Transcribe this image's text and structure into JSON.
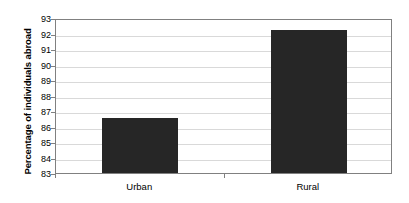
{
  "chart_data": {
    "type": "bar",
    "title": "",
    "xlabel": "",
    "ylabel": "Percentage of individuals abroad",
    "categories": [
      "Urban",
      "Rural"
    ],
    "values": [
      86.55,
      92.2
    ],
    "ylim": [
      83,
      93
    ],
    "ytick_step": 1,
    "yticks": [
      93,
      92,
      91,
      90,
      89,
      88,
      87,
      86,
      85,
      84,
      83
    ],
    "grid": true,
    "grid_axis": "y",
    "legend": false,
    "legend_position": "none",
    "colors": {
      "bar_fill": "#262626",
      "gridline": "#d9d9d9",
      "axis_line": "#808080",
      "text": "#000000",
      "background": "#ffffff"
    }
  },
  "axes": {
    "y_title": "Percentage of individuals abroad",
    "y_tick_labels": [
      "93",
      "92",
      "91",
      "90",
      "89",
      "88",
      "87",
      "86",
      "85",
      "84",
      "83"
    ],
    "x_tick_labels": [
      "Urban",
      "Rural"
    ]
  }
}
